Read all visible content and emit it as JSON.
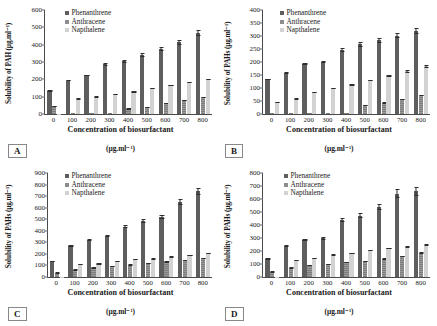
{
  "figure": {
    "panels": [
      "A",
      "B",
      "C",
      "D"
    ]
  },
  "common": {
    "xlabel": "Concentration of biosurfactant",
    "xunit": "(µg.ml⁻¹)",
    "legend": [
      "Phenanthrene",
      "Anthracene",
      "Napthalene"
    ],
    "categories": [
      "0",
      "100",
      "200",
      "300",
      "400",
      "500",
      "600",
      "700",
      "800"
    ],
    "colors": {
      "phenanthrene": "#5e5e5e",
      "anthracene": "#8d8d8d",
      "napthalene": "#d2d2d2"
    }
  },
  "chart_data": [
    {
      "type": "bar",
      "panel": "A",
      "title": "",
      "xlabel": "Concentration of biosurfactant (µg.ml⁻¹)",
      "ylabel": "Solubility of PAH (µg.ml⁻¹)",
      "ylim": [
        0,
        600
      ],
      "yticks": [
        0,
        100,
        200,
        300,
        400,
        500,
        600
      ],
      "grid": false,
      "legend_position": "top-left",
      "categories": [
        "0",
        "100",
        "200",
        "300",
        "400",
        "500",
        "600",
        "700",
        "800"
      ],
      "series": [
        {
          "name": "Phenanthrene",
          "values": [
            133,
            193,
            224,
            287,
            303,
            341,
            374,
            414,
            468
          ],
          "errors": [
            8,
            12,
            10,
            13,
            14,
            16,
            17,
            19,
            20
          ]
        },
        {
          "name": "Anthracene",
          "values": [
            44,
            4,
            5,
            4,
            30,
            38,
            62,
            80,
            95
          ],
          "errors": [
            6,
            2,
            2,
            2,
            5,
            6,
            7,
            9,
            10
          ]
        },
        {
          "name": "Napthalene",
          "values": [
            2,
            87,
            98,
            113,
            128,
            148,
            167,
            183,
            200
          ],
          "errors": [
            1,
            4,
            5,
            6,
            8,
            9,
            11,
            12,
            13
          ]
        }
      ]
    },
    {
      "type": "bar",
      "panel": "B",
      "title": "",
      "xlabel": "Concentration of biosurfactant (µg.ml⁻¹)",
      "ylabel": "Solubility of PAHs (µg.ml⁻¹)",
      "ylim": [
        0,
        400
      ],
      "yticks": [
        0,
        50,
        100,
        150,
        200,
        250,
        300,
        350,
        400
      ],
      "grid": false,
      "legend_position": "top-left",
      "categories": [
        "0",
        "100",
        "200",
        "300",
        "400",
        "500",
        "600",
        "700",
        "800"
      ],
      "series": [
        {
          "name": "Phenanthrene",
          "values": [
            133,
            158,
            192,
            200,
            246,
            268,
            283,
            301,
            320
          ],
          "errors": [
            7,
            9,
            8,
            9,
            11,
            12,
            13,
            12,
            13
          ]
        },
        {
          "name": "Anthracene",
          "values": [
            2,
            2,
            2,
            2,
            2,
            33,
            42,
            56,
            70
          ],
          "errors": [
            1,
            1,
            1,
            1,
            1,
            5,
            6,
            7,
            8
          ]
        },
        {
          "name": "Napthalene",
          "values": [
            45,
            58,
            84,
            99,
            112,
            130,
            148,
            164,
            183
          ],
          "errors": [
            3,
            3,
            4,
            5,
            6,
            7,
            9,
            10,
            11
          ]
        }
      ]
    },
    {
      "type": "bar",
      "panel": "C",
      "title": "",
      "xlabel": "Concentration of biosurfactant (µg.ml⁻¹)",
      "ylabel": "Solubility of PAHs (µg.ml⁻¹)",
      "ylim": [
        0,
        900
      ],
      "yticks": [
        0,
        100,
        200,
        300,
        400,
        500,
        600,
        700,
        800,
        900
      ],
      "grid": false,
      "legend_position": "top-left",
      "categories": [
        "0",
        "100",
        "200",
        "300",
        "400",
        "500",
        "600",
        "700",
        "800"
      ],
      "series": [
        {
          "name": "Phenanthrene",
          "values": [
            137,
            272,
            322,
            356,
            435,
            488,
            522,
            652,
            742
          ],
          "errors": [
            8,
            22,
            20,
            22,
            26,
            28,
            30,
            34,
            36
          ]
        },
        {
          "name": "Anthracene",
          "values": [
            35,
            62,
            78,
            92,
            103,
            120,
            130,
            145,
            158
          ],
          "errors": [
            5,
            7,
            8,
            9,
            10,
            11,
            12,
            13,
            14
          ]
        },
        {
          "name": "Napthalene",
          "values": [
            2,
            110,
            113,
            135,
            152,
            158,
            175,
            190,
            207
          ],
          "errors": [
            1,
            7,
            7,
            9,
            10,
            10,
            12,
            13,
            14
          ]
        }
      ]
    },
    {
      "type": "bar",
      "panel": "D",
      "title": "",
      "xlabel": "Concentration of biosurfactant (µg.ml⁻¹)",
      "ylabel": "Solubility of PAHs (µg.ml⁻¹)",
      "ylim": [
        0,
        800
      ],
      "yticks": [
        0,
        100,
        200,
        300,
        400,
        500,
        600,
        700,
        800
      ],
      "grid": false,
      "legend_position": "top-left",
      "categories": [
        "0",
        "100",
        "200",
        "300",
        "400",
        "500",
        "600",
        "700",
        "800"
      ],
      "series": [
        {
          "name": "Phenanthrene",
          "values": [
            139,
            240,
            283,
            297,
            440,
            472,
            538,
            642,
            660
          ],
          "errors": [
            8,
            18,
            20,
            21,
            30,
            30,
            34,
            40,
            42
          ]
        },
        {
          "name": "Anthracene",
          "values": [
            38,
            70,
            88,
            97,
            112,
            122,
            140,
            158,
            185
          ],
          "errors": [
            5,
            8,
            9,
            10,
            11,
            12,
            13,
            14,
            16
          ]
        },
        {
          "name": "Napthalene",
          "values": [
            2,
            126,
            144,
            170,
            182,
            205,
            222,
            232,
            245
          ],
          "errors": [
            1,
            9,
            10,
            12,
            13,
            14,
            15,
            16,
            17
          ]
        }
      ]
    }
  ]
}
